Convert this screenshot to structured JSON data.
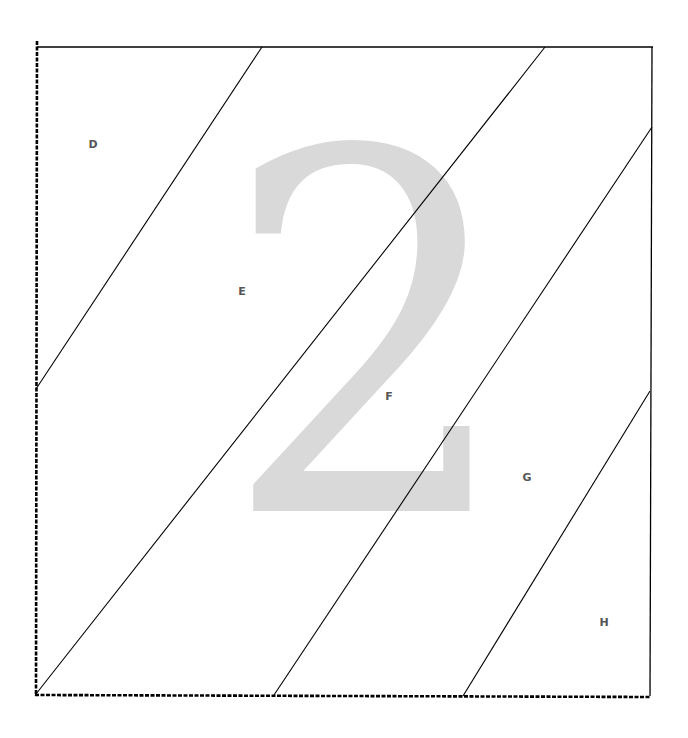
{
  "diagram": {
    "watermark": {
      "text": "2",
      "color": "#d9d9d9"
    },
    "frame": {
      "top_left": [
        37,
        47
      ],
      "top_right": [
        653,
        47
      ],
      "bottom_right": [
        650,
        696
      ],
      "bottom_left": [
        36,
        694
      ],
      "solid_edges": [
        "top",
        "right"
      ],
      "dashed_edges": [
        "left",
        "bottom"
      ],
      "stroke_color": "#000000"
    },
    "diagonals": [
      {
        "from": [
          262,
          47
        ],
        "to": [
          36,
          389
        ]
      },
      {
        "from": [
          545,
          47
        ],
        "to": [
          36,
          694
        ]
      },
      {
        "from": [
          652,
          127
        ],
        "to": [
          274,
          695
        ]
      },
      {
        "from": [
          650,
          391
        ],
        "to": [
          463,
          696
        ]
      }
    ],
    "regions": [
      {
        "label": "D",
        "x": 93,
        "y": 144
      },
      {
        "label": "E",
        "x": 242,
        "y": 291
      },
      {
        "label": "F",
        "x": 389,
        "y": 396
      },
      {
        "label": "G",
        "x": 527,
        "y": 477
      },
      {
        "label": "H",
        "x": 604,
        "y": 622
      }
    ],
    "label_color": "#555555"
  }
}
